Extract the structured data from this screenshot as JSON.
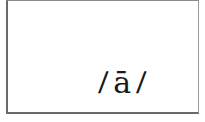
{
  "card": {
    "left_delimiter": "/",
    "phoneme": "ā",
    "right_delimiter": "/"
  },
  "colors": {
    "border": "#6e6e6e",
    "text": "#1a1a1a",
    "background": "#ffffff"
  }
}
